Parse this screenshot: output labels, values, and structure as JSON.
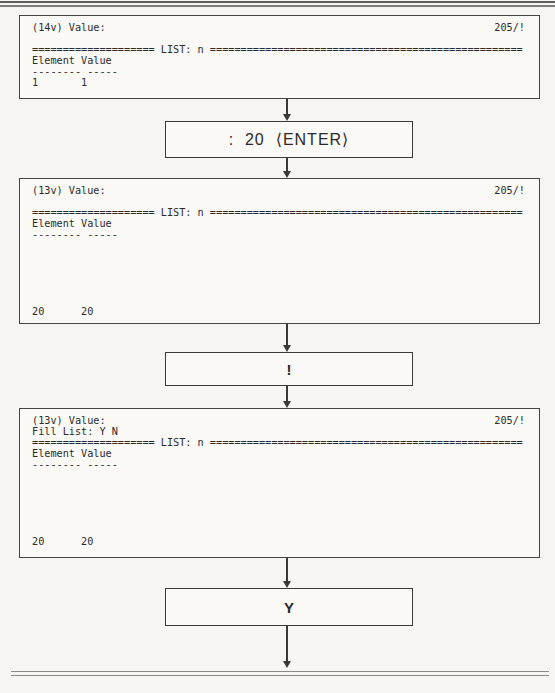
{
  "page": {
    "background": "#f6f5f2",
    "ink": "#2b2b2b",
    "rule_color": "#7c7c7c",
    "box_border_color": "#454545"
  },
  "screens": [
    {
      "status": "205/!",
      "lines": [
        "(14v) Value:",
        "",
        "==================== LIST: n ===================================================",
        "Element Value",
        "-------- -----",
        "1       1"
      ]
    },
    {
      "status": "205/!",
      "lines": [
        "(13v) Value:",
        "",
        "==================== LIST: n ===================================================",
        "Element Value",
        "-------- -----",
        "",
        "",
        "",
        "",
        "",
        "",
        "20      20"
      ]
    },
    {
      "status": "205/!",
      "lines": [
        "(13v) Value:",
        "Fill List: Y N",
        "==================== LIST: n ===================================================",
        "Element Value",
        "-------- -----",
        "",
        "",
        "",
        "",
        "",
        "",
        "20      20"
      ]
    }
  ],
  "keys": [
    {
      "label": ":  20  ⟨ENTER⟩"
    },
    {
      "label": "!"
    },
    {
      "label": "Y"
    }
  ]
}
